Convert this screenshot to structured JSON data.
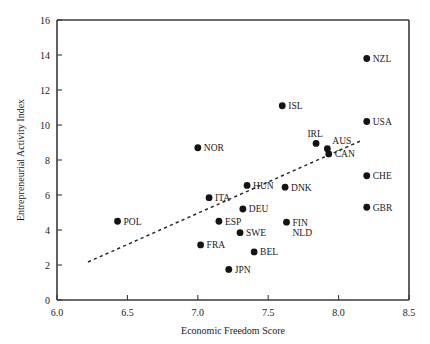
{
  "chart_data": {
    "type": "scatter",
    "title": "",
    "xlabel": "Economic Freedom Score",
    "ylabel": "Entrepreneurial Activity Index",
    "xlim": [
      6.0,
      8.5
    ],
    "ylim": [
      0,
      16
    ],
    "xticks": [
      "6.0",
      "6.5",
      "7.0",
      "7.5",
      "8.0",
      "8.5"
    ],
    "xtick_values": [
      6.0,
      6.5,
      7.0,
      7.5,
      8.0,
      8.5
    ],
    "yticks": [
      "0",
      "2",
      "4",
      "6",
      "8",
      "10",
      "12",
      "14",
      "16"
    ],
    "ytick_values": [
      0,
      2,
      4,
      6,
      8,
      10,
      12,
      14,
      16
    ],
    "grid": false,
    "legend": "none",
    "marker": "filled-circle",
    "marker_color": "#141414",
    "points": [
      {
        "label": "NZL",
        "x": 8.2,
        "y": 13.8,
        "label_pos": "right"
      },
      {
        "label": "ISL",
        "x": 7.6,
        "y": 11.1,
        "label_pos": "right"
      },
      {
        "label": "USA",
        "x": 8.2,
        "y": 10.2,
        "label_pos": "right"
      },
      {
        "label": "IRL",
        "x": 7.84,
        "y": 8.95,
        "label_pos": "above-left"
      },
      {
        "label": "AUS",
        "x": 7.92,
        "y": 8.65,
        "label_pos": "above-right"
      },
      {
        "label": "CAN",
        "x": 7.93,
        "y": 8.35,
        "label_pos": "right"
      },
      {
        "label": "NOR",
        "x": 7.0,
        "y": 8.7,
        "label_pos": "right"
      },
      {
        "label": "CHE",
        "x": 8.2,
        "y": 7.1,
        "label_pos": "right"
      },
      {
        "label": "GBR",
        "x": 8.2,
        "y": 5.3,
        "label_pos": "right"
      },
      {
        "label": "HUN",
        "x": 7.35,
        "y": 6.55,
        "label_pos": "right"
      },
      {
        "label": "DNK",
        "x": 7.62,
        "y": 6.45,
        "label_pos": "right"
      },
      {
        "label": "ITA",
        "x": 7.08,
        "y": 5.85,
        "label_pos": "right"
      },
      {
        "label": "DEU",
        "x": 7.32,
        "y": 5.2,
        "label_pos": "right"
      },
      {
        "label": "ESP",
        "x": 7.15,
        "y": 4.5,
        "label_pos": "right"
      },
      {
        "label": "POL",
        "x": 6.43,
        "y": 4.5,
        "label_pos": "right"
      },
      {
        "label": "FIN",
        "x": 7.63,
        "y": 4.45,
        "label_pos": "right"
      },
      {
        "label": "NLD",
        "x": 7.63,
        "y": 4.45,
        "label_pos": "below-right"
      },
      {
        "label": "SWE",
        "x": 7.3,
        "y": 3.85,
        "label_pos": "right"
      },
      {
        "label": "FRA",
        "x": 7.02,
        "y": 3.15,
        "label_pos": "right"
      },
      {
        "label": "BEL",
        "x": 7.4,
        "y": 2.75,
        "label_pos": "right"
      },
      {
        "label": "JPN",
        "x": 7.22,
        "y": 1.75,
        "label_pos": "right"
      }
    ],
    "trend_line": {
      "style": "dashed",
      "x_start": 6.22,
      "y_start": 2.17,
      "x_end": 8.17,
      "y_end": 9.14
    }
  }
}
